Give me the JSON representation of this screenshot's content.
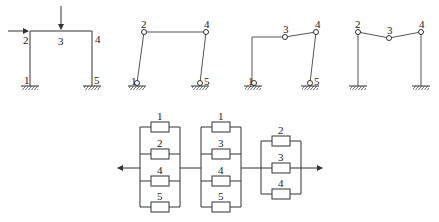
{
  "frames": [
    {
      "id": "frame-1",
      "description": "Portal frame with loads",
      "labels": {
        "n1": "1",
        "n2": "2",
        "n3": "3",
        "n4": "4",
        "n5": "5"
      }
    },
    {
      "id": "frame-2",
      "description": "Mechanism with hinges at 1,2,4,5",
      "labels": {
        "n1": "1",
        "n2": "2",
        "n4": "4",
        "n5": "5"
      }
    },
    {
      "id": "frame-3",
      "description": "Mechanism with hinges at 1,3,4,5",
      "labels": {
        "n1": "1",
        "n3": "3",
        "n4": "4",
        "n5": "5"
      }
    },
    {
      "id": "frame-4",
      "description": "Beam mechanism with hinges at 2,3,4",
      "labels": {
        "n2": "2",
        "n3": "3",
        "n4": "4"
      }
    }
  ],
  "reliability_network": {
    "groups": [
      {
        "id": "group-1",
        "elements": [
          "1",
          "2",
          "4",
          "5"
        ]
      },
      {
        "id": "group-2",
        "elements": [
          "1",
          "3",
          "4",
          "5"
        ]
      },
      {
        "id": "group-3",
        "elements": [
          "2",
          "3",
          "4"
        ]
      }
    ]
  }
}
